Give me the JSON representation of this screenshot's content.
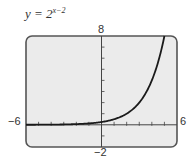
{
  "title": {
    "lhs": "y = 2",
    "exponent": "x−2"
  },
  "window": {
    "xmin_label": "−6",
    "xmax_label": "6",
    "ymax_label": "8",
    "ymin_label": "−2"
  },
  "colors": {
    "screen_bg": "#ebebeb",
    "frame": "#555555",
    "curve": "#1a1a1a",
    "axis": "#444444"
  },
  "chart_data": {
    "type": "line",
    "xlabel": "",
    "ylabel": "",
    "xlim": [
      -6,
      6
    ],
    "ylim": [
      -2,
      8
    ],
    "x_ticks_step": 1,
    "y_ticks_step": 1,
    "grid": false,
    "series": [
      {
        "name": "y = 2^(x-2)",
        "x": [
          -6,
          -5,
          -4,
          -3,
          -2,
          -1,
          0,
          1,
          2,
          3,
          4,
          5
        ],
        "values": [
          0.0039,
          0.0078,
          0.0156,
          0.031,
          0.0625,
          0.125,
          0.25,
          0.5,
          1,
          2,
          4,
          8
        ]
      }
    ]
  }
}
